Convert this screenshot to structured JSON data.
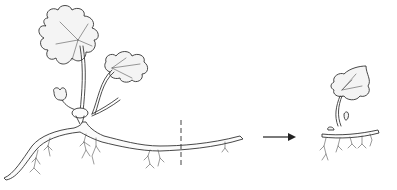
{
  "figure": {
    "left_panel": {
      "subject": "parent plant with horizontal root",
      "features": [
        "large lobed leaf",
        "smaller lobed leaf",
        "young bud leaf",
        "crown",
        "horizontal root",
        "fibrous rootlets",
        "dashed cut line"
      ]
    },
    "arrow": {
      "direction": "right"
    },
    "right_panel": {
      "subject": "new plantlet from root cutting",
      "features": [
        "single lobed leaf",
        "small bud",
        "root section",
        "fibrous rootlets"
      ]
    },
    "colors": {
      "line": "#333333",
      "background": "#ffffff",
      "leaf_fill": "#f4f4f4"
    }
  }
}
